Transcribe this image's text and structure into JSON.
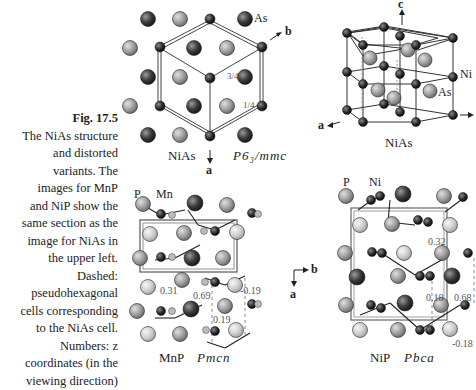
{
  "caption": {
    "figure_number": "Fig. 17.5",
    "lines": [
      "The NiAs structure",
      "and distorted",
      "variants. The",
      "images for MnP",
      "and NiP show the",
      "same section as the",
      "image for NiAs in",
      "the upper left.",
      "Dashed:",
      "pseudohexagonal",
      "cells corresponding",
      "to the NiAs cell.",
      "Numbers: z",
      "coordinates (in the",
      "viewing direction)"
    ]
  },
  "panels": {
    "niAs_projection": {
      "atom_label": "As",
      "axis_b": "b",
      "axis_a": "a",
      "z_high": "3/4",
      "z_low": "1/4",
      "name": "NiAs",
      "space_group": "P6₃/mmc"
    },
    "niAs_3d": {
      "axis_c": "c",
      "axis_a": "a",
      "label_ni": "Ni",
      "label_as": "As",
      "name": "NiAs"
    },
    "mnP": {
      "label_p": "P",
      "label_mn": "Mn",
      "z_values": [
        "0.31",
        "0.69",
        "0.19",
        "-0.19"
      ],
      "name": "MnP",
      "space_group": "Pmcn"
    },
    "axes_legend": {
      "b": "b",
      "a": "a"
    },
    "niP": {
      "label_p": "P",
      "label_ni": "Ni",
      "z_values": [
        "0.32",
        "0.18",
        "0.68",
        "-0.18"
      ],
      "name": "NiP",
      "space_group": "Pbca"
    }
  }
}
